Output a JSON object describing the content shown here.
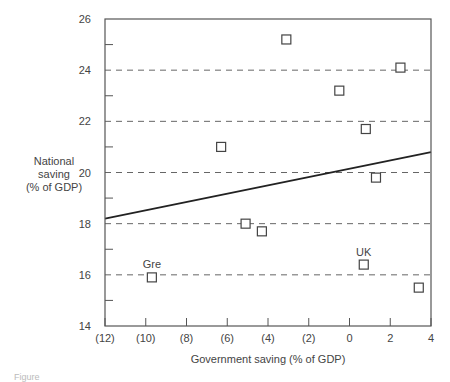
{
  "chart_data": {
    "type": "scatter",
    "title": "",
    "xlabel": "Government saving (% of GDP)",
    "ylabel": [
      "National",
      "saving",
      "(% of GDP)"
    ],
    "xlim": [
      -12,
      4
    ],
    "ylim": [
      14,
      26
    ],
    "x_ticks": [
      -12,
      -10,
      -8,
      -6,
      -4,
      -2,
      0,
      2,
      4
    ],
    "x_tick_labels": [
      "(12)",
      "(10)",
      "(8)",
      "(6)",
      "(4)",
      "(2)",
      "0",
      "2",
      "4"
    ],
    "y_ticks": [
      14,
      16,
      18,
      20,
      22,
      24,
      26
    ],
    "y_tick_labels": [
      "14",
      "16",
      "18",
      "20",
      "22",
      "24",
      "26"
    ],
    "y_minor_ticks": [
      15,
      17,
      19,
      21,
      23,
      25
    ],
    "grid": {
      "horizontal_dashed_at": [
        16,
        18,
        20,
        22,
        24
      ]
    },
    "marker": "open-square",
    "points": [
      {
        "x": -9.7,
        "y": 15.9,
        "label": "Gre"
      },
      {
        "x": -6.3,
        "y": 21.0,
        "label": ""
      },
      {
        "x": -5.1,
        "y": 18.0,
        "label": ""
      },
      {
        "x": -4.3,
        "y": 17.7,
        "label": ""
      },
      {
        "x": -3.1,
        "y": 25.2,
        "label": ""
      },
      {
        "x": -0.5,
        "y": 23.2,
        "label": ""
      },
      {
        "x": 0.7,
        "y": 16.4,
        "label": "UK"
      },
      {
        "x": 0.8,
        "y": 21.7,
        "label": ""
      },
      {
        "x": 1.3,
        "y": 19.8,
        "label": ""
      },
      {
        "x": 2.5,
        "y": 24.1,
        "label": ""
      },
      {
        "x": 3.4,
        "y": 15.5,
        "label": ""
      }
    ],
    "trend_line": {
      "x": [
        -12,
        4
      ],
      "y": [
        18.2,
        20.8
      ]
    },
    "legend": null
  },
  "caption": "Figure"
}
